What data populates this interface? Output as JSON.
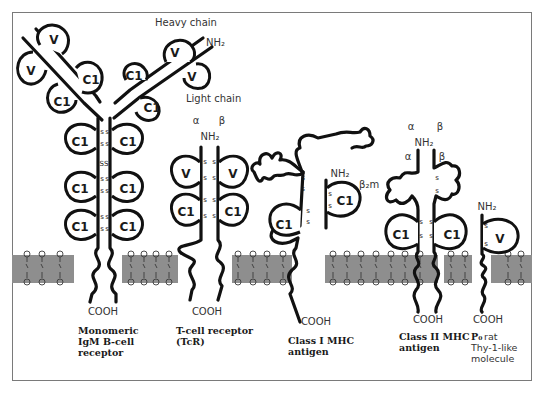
{
  "figure": {
    "type": "diagram",
    "colors": {
      "chain": "#111111",
      "membrane": "#8e8e8e",
      "frame": "#7a7a7a",
      "background": "#ffffff"
    }
  },
  "labels": {
    "heavy_chain": "Heavy chain",
    "light_chain": "Light chain",
    "nh2": "NH₂",
    "cooh": "COOH",
    "alpha": "α",
    "beta": "β",
    "beta2m": "β₂m",
    "ss": "SS",
    "s": "S"
  },
  "domains": {
    "v": "V",
    "c1": "C1"
  },
  "molecules": [
    {
      "id": "igm",
      "caption": [
        "Monomeric",
        "IgM B-cell",
        "receptor"
      ],
      "caption_bold": true
    },
    {
      "id": "tcr",
      "caption": [
        "T-cell receptor",
        "(TcR)"
      ],
      "caption_bold": true
    },
    {
      "id": "mhc1",
      "caption": [
        "Class I MHC",
        "antigen"
      ],
      "caption_bold": true
    },
    {
      "id": "mhc2",
      "caption": [
        "Class II MHC",
        "antigen"
      ],
      "caption_bold": true
    },
    {
      "id": "p0",
      "caption_bold_part": "P₀",
      "caption": [
        " rat",
        "Thy-1-like",
        "molecule"
      ],
      "caption_bold": false
    }
  ]
}
